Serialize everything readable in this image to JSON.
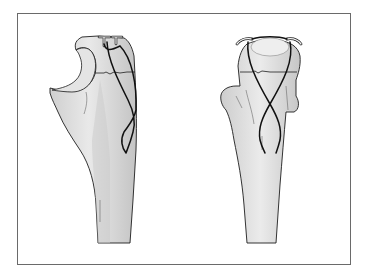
{
  "figure": {
    "panels": [
      {
        "name": "lateral-view",
        "elements": [
          "bone",
          "k-wires",
          "figure-eight-wire",
          "fracture-line"
        ]
      },
      {
        "name": "anteroposterior-view",
        "elements": [
          "bone",
          "k-wires",
          "figure-eight-wire",
          "fracture-line"
        ]
      }
    ]
  },
  "colors": {
    "frame_border": "#6a6a6a",
    "bone_fill": "#d6d6d6",
    "bone_highlight": "#ececec",
    "bone_shade": "#bdbdbd",
    "outline": "#1e1e1e",
    "wire": "#111111",
    "pin": "#f4f4f4"
  }
}
